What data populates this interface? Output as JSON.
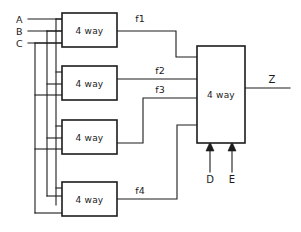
{
  "diagram": {
    "type": "logic-circuit-schematic",
    "canvas": {
      "width": 301,
      "height": 232,
      "background": "#ffffff"
    },
    "stroke_color": "#1c1c1c",
    "inputs": [
      {
        "id": "A",
        "label": "A",
        "side": "left",
        "x": 18,
        "y": 22,
        "bus_y": 19
      },
      {
        "id": "B",
        "label": "B",
        "side": "left",
        "x": 18,
        "y": 34,
        "bus_y": 31
      },
      {
        "id": "C",
        "label": "C",
        "side": "left",
        "x": 18,
        "y": 46,
        "bus_y": 43
      },
      {
        "id": "D",
        "label": "D",
        "side": "bottom",
        "x": 210,
        "y": 180
      },
      {
        "id": "E",
        "label": "E",
        "side": "bottom",
        "x": 232,
        "y": 180
      }
    ],
    "outputs": [
      {
        "id": "Z",
        "label": "Z",
        "side": "right",
        "x": 272,
        "y": 85
      }
    ],
    "gates": [
      {
        "id": "g1",
        "label": "4 way",
        "x": 62,
        "y": 13,
        "w": 55,
        "h": 34,
        "output_signal": "f1"
      },
      {
        "id": "g2",
        "label": "4 way",
        "x": 62,
        "y": 66,
        "w": 55,
        "h": 34,
        "output_signal": "f2"
      },
      {
        "id": "g3",
        "label": "4 way",
        "x": 62,
        "y": 120,
        "w": 55,
        "h": 34,
        "output_signal": "f3"
      },
      {
        "id": "g4",
        "label": "4 way",
        "x": 62,
        "y": 182,
        "w": 55,
        "h": 34,
        "output_signal": "f4"
      },
      {
        "id": "gmain",
        "label": "4 way",
        "x": 197,
        "y": 46,
        "w": 48,
        "h": 97,
        "output_signal": "Z"
      }
    ],
    "signals": [
      {
        "id": "f1",
        "label": "f1",
        "x": 140,
        "y": 18,
        "from": "g1",
        "to": "gmain"
      },
      {
        "id": "f2",
        "label": "f2",
        "x": 160,
        "y": 72,
        "from": "g2",
        "to": "gmain"
      },
      {
        "id": "f3",
        "label": "f3",
        "x": 160,
        "y": 93,
        "from": "g3",
        "to": "gmain"
      },
      {
        "id": "f4",
        "label": "f4",
        "x": 140,
        "y": 190,
        "from": "g4",
        "to": "gmain"
      }
    ]
  }
}
